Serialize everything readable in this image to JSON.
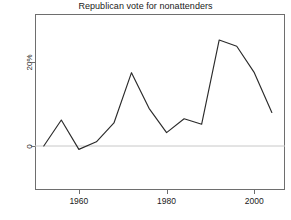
{
  "chart_data": {
    "type": "line",
    "title": "Republican vote for nonattenders",
    "xlabel": "",
    "ylabel": "Difference in Republican vote",
    "x": [
      1952,
      1956,
      1960,
      1964,
      1968,
      1972,
      1976,
      1980,
      1984,
      1988,
      1992,
      1996,
      2000,
      2004
    ],
    "values": [
      0.0,
      6.2,
      -0.8,
      1.0,
      5.5,
      17.5,
      9.0,
      3.2,
      6.5,
      5.2,
      25.3,
      23.8,
      17.5,
      8.0
    ],
    "series": [
      {
        "name": "Difference in Republican vote",
        "values": [
          0.0,
          6.2,
          -0.8,
          1.0,
          5.5,
          17.5,
          9.0,
          3.2,
          6.5,
          5.2,
          25.3,
          23.8,
          17.5,
          8.0
        ]
      }
    ],
    "xlim": [
      1950,
      2007
    ],
    "ylim": [
      -10.5,
      31.5
    ],
    "xticks": [
      1960,
      1980,
      2000
    ],
    "xtick_labels": [
      "1960",
      "1980",
      "2000"
    ],
    "yticks": [
      0,
      20
    ],
    "ytick_labels": [
      "0",
      "20%"
    ],
    "grid": false,
    "legend": false,
    "reference_line_y": 0,
    "line_color": "#2b2b2b",
    "reference_line_color": "#c8c8c8",
    "frame_color": "#6e6e6e"
  },
  "figure": {
    "title": "Republican vote for nonattenders",
    "y_axis_label": "Difference in Republican vote"
  }
}
